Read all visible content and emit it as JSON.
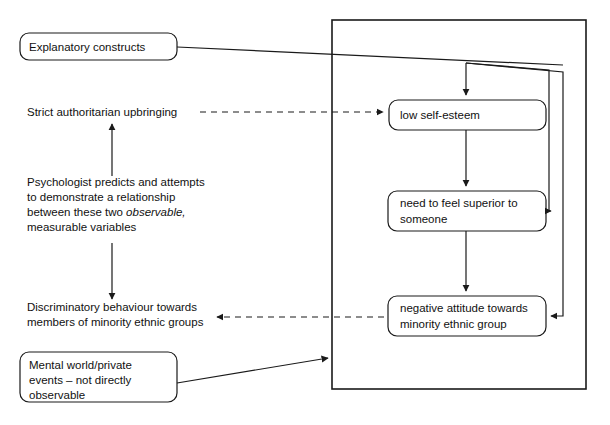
{
  "diagram": {
    "colors": {
      "stroke": "#1a1a1a",
      "fill": "#ffffff",
      "text": "#111111",
      "background": "#ffffff"
    },
    "left_boxes": [
      {
        "id": "explanatory-constructs",
        "lines": [
          "Explanatory constructs"
        ],
        "x": 20,
        "y": 33,
        "w": 157,
        "h": 27,
        "r": 9
      },
      {
        "id": "mental-world",
        "lines": [
          "Mental world/private",
          "events – not directly",
          "observable"
        ],
        "x": 20,
        "y": 352,
        "w": 157,
        "h": 50,
        "r": 9
      }
    ],
    "left_labels": [
      {
        "id": "strict-authoritarian-upbringing",
        "lines": [
          {
            "text": "Strict authoritarian upbringing",
            "italic": false
          }
        ],
        "x": 27,
        "y": 116
      },
      {
        "id": "psychologist-note",
        "lines": [
          {
            "text": "Psychologist predicts and attempts",
            "italic": false
          },
          {
            "text": "to demonstrate a relationship",
            "italic": false
          },
          {
            "text": "between these two ",
            "italic": false,
            "tail": "observable,",
            "tail_italic": true
          },
          {
            "text": "measurable variables",
            "italic": false
          }
        ],
        "x": 27,
        "y": 186
      },
      {
        "id": "discriminatory-behaviour",
        "lines": [
          {
            "text": "Discriminatory behaviour towards",
            "italic": false
          },
          {
            "text": "members of minority ethnic groups",
            "italic": false
          }
        ],
        "x": 27,
        "y": 311
      }
    ],
    "frame": {
      "id": "mental-world-frame",
      "x": 332,
      "y": 20,
      "w": 254,
      "h": 369
    },
    "right_boxes": [
      {
        "id": "low-self-esteem",
        "lines": [
          "low self-esteem"
        ],
        "x": 389,
        "y": 100,
        "w": 157,
        "h": 30,
        "r": 9
      },
      {
        "id": "need-to-feel-superior",
        "lines": [
          "need to feel superior to",
          "someone"
        ],
        "x": 388,
        "y": 191,
        "w": 158,
        "h": 40,
        "r": 9
      },
      {
        "id": "negative-attitude",
        "lines": [
          "negative attitude towards",
          "minority ethnic group"
        ],
        "x": 388,
        "y": 296,
        "w": 158,
        "h": 40,
        "r": 9
      }
    ],
    "connectors": [
      {
        "id": "explanatory-constructs-to-frame",
        "kind": "solid",
        "arrow": false,
        "note": "line from Explanatory constructs box right edge sloping to top-right feedback rail"
      },
      {
        "id": "mental-world-to-frame",
        "kind": "solid",
        "arrow": true,
        "note": "line from Mental world box right edge sloping up into frame"
      },
      {
        "id": "upbringing-to-low-self-esteem",
        "kind": "dashed",
        "arrow": "right",
        "note": "Strict authoritarian upbringing to low self-esteem"
      },
      {
        "id": "negative-attitude-to-discriminatory-behaviour",
        "kind": "dashed",
        "arrow": "left",
        "note": "negative attitude box to Discriminatory behaviour text"
      },
      {
        "id": "psychologist-note-up",
        "kind": "solid",
        "arrow": "up",
        "note": "from note block up to Strict authoritarian upbringing"
      },
      {
        "id": "psychologist-note-down",
        "kind": "solid",
        "arrow": "down",
        "note": "from note block down to Discriminatory behaviour"
      },
      {
        "id": "low-self-esteem-to-need",
        "kind": "solid",
        "arrow": "down",
        "note": "low self-esteem to need to feel superior to someone"
      },
      {
        "id": "need-to-negative-attitude",
        "kind": "solid",
        "arrow": "down",
        "note": "need to feel superior to negative attitude"
      },
      {
        "id": "feedback-to-need",
        "kind": "solid",
        "arrow": "left",
        "note": "feedback rail into right edge of need to feel superior box"
      },
      {
        "id": "feedback-to-negative-attitude",
        "kind": "solid",
        "arrow": "left",
        "note": "feedback rail into right edge of negative attitude box"
      },
      {
        "id": "inflow-to-low-self-esteem",
        "kind": "solid",
        "arrow": "down",
        "note": "vertical arrow into top of low self-esteem"
      }
    ]
  }
}
